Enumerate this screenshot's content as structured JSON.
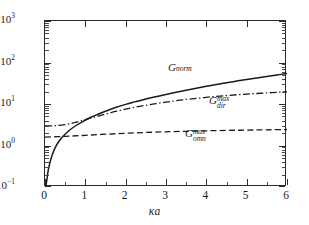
{
  "figure": {
    "background": "#ffffff",
    "axis_color": "#2b2b2b"
  },
  "chart_data": {
    "type": "line",
    "title": "",
    "xlabel": "κa",
    "ylabel": "",
    "xlim": [
      0,
      6
    ],
    "ylim": [
      0.1,
      1000
    ],
    "yscale": "log",
    "xscale": "linear",
    "grid": false,
    "legend": "inline-annotations",
    "xticks": [
      0,
      1,
      2,
      3,
      4,
      5,
      6
    ],
    "xticklabels": [
      "0",
      "1",
      "2",
      "3",
      "4",
      "5",
      "6"
    ],
    "yticks": [
      0.1,
      1,
      10,
      100,
      1000
    ],
    "yticklabels": [
      "10⁻¹",
      "10⁰",
      "10¹",
      "10²",
      "10³"
    ],
    "series": [
      {
        "name": "G_norm",
        "label": "G",
        "label_sub": "norm",
        "label_sup": "",
        "style": "solid",
        "color": "#1a1a1a",
        "x": [
          0.02,
          0.05,
          0.08,
          0.12,
          0.18,
          0.25,
          0.35,
          0.45,
          0.6,
          0.75,
          0.9,
          1.1,
          1.3,
          1.5,
          1.75,
          2.0,
          2.25,
          2.5,
          2.75,
          3.0,
          3.25,
          3.5,
          3.75,
          4.0,
          4.25,
          4.5,
          4.75,
          5.0,
          5.25,
          5.5,
          5.75,
          6.0
        ],
        "y": [
          0.1,
          0.16,
          0.25,
          0.38,
          0.6,
          0.88,
          1.28,
          1.68,
          2.3,
          2.95,
          3.6,
          4.6,
          5.6,
          6.7,
          8.2,
          9.8,
          11.4,
          13.2,
          15.0,
          17.0,
          19.2,
          21.5,
          24.0,
          26.7,
          29.5,
          32.5,
          35.6,
          39.0,
          42.5,
          46.2,
          50.2,
          54.5
        ]
      },
      {
        "name": "G_dir^max",
        "label": "G",
        "label_sub": "dir",
        "label_sup": "max",
        "style": "dashdot",
        "color": "#1a1a1a",
        "x": [
          0.0,
          0.25,
          0.5,
          0.75,
          1.0,
          1.25,
          1.5,
          1.75,
          2.0,
          2.25,
          2.5,
          2.75,
          3.0,
          3.25,
          3.5,
          3.75,
          4.0,
          4.25,
          4.5,
          4.75,
          5.0,
          5.25,
          5.5,
          5.75,
          6.0
        ],
        "y": [
          2.95,
          3.0,
          3.2,
          3.6,
          4.2,
          4.9,
          5.7,
          6.6,
          7.5,
          8.4,
          9.3,
          10.2,
          11.1,
          12.0,
          12.9,
          13.7,
          14.5,
          15.3,
          16.0,
          16.7,
          17.3,
          17.9,
          18.5,
          19.1,
          19.7
        ]
      },
      {
        "name": "G_omn^max",
        "label": "G",
        "label_sub": "omn",
        "label_sup": "max",
        "style": "dashed",
        "color": "#1a1a1a",
        "x": [
          0.0,
          0.5,
          1.0,
          1.5,
          2.0,
          2.5,
          3.0,
          3.5,
          4.0,
          4.5,
          5.0,
          5.5,
          6.0
        ],
        "y": [
          1.6,
          1.66,
          1.76,
          1.87,
          1.97,
          2.06,
          2.14,
          2.2,
          2.26,
          2.31,
          2.35,
          2.39,
          2.43
        ]
      }
    ],
    "annotations": [
      {
        "name": "gnorm-label",
        "text": "G norm",
        "x_px": 168,
        "y_px": 62
      },
      {
        "name": "gdirmax-label",
        "text": "G dir max",
        "x_px": 209,
        "y_px": 96
      },
      {
        "name": "gomnmax-label",
        "text": "G omn max",
        "x_px": 185,
        "y_px": 129
      }
    ]
  }
}
